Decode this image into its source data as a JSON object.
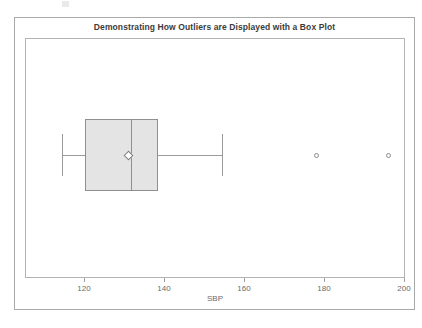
{
  "figure": {
    "title": "Demonstrating How Outliers are Displayed with a Box Plot",
    "axis_title": "SBP",
    "box_fill_color": "#e4e4e4",
    "line_color": "#8f8f8f",
    "frame_color": "#a9a9a9"
  },
  "chart_data": {
    "type": "boxplot",
    "title": "Demonstrating How Outliers are Displayed with a Box Plot",
    "xlabel": "SBP",
    "ylabel": "",
    "orientation": "horizontal",
    "grid": false,
    "legend": null,
    "xlim": [
      104,
      200
    ],
    "xticks": [
      120,
      140,
      160,
      180,
      200
    ],
    "xticklabels": [
      "120",
      "140",
      "160",
      "180",
      "200"
    ],
    "boxes": [
      {
        "name": "SBP",
        "whisker_low": 114.5,
        "q1": 120.2,
        "median": 131.7,
        "mean": 131.0,
        "q3": 138.5,
        "whisker_high": 154.5,
        "outliers": [
          178.0,
          196.0
        ]
      }
    ]
  },
  "ticks": [
    {
      "label": "120",
      "value": 120
    },
    {
      "label": "140",
      "value": 140
    },
    {
      "label": "160",
      "value": 160
    },
    {
      "label": "180",
      "value": 180
    },
    {
      "label": "200",
      "value": 200
    }
  ]
}
